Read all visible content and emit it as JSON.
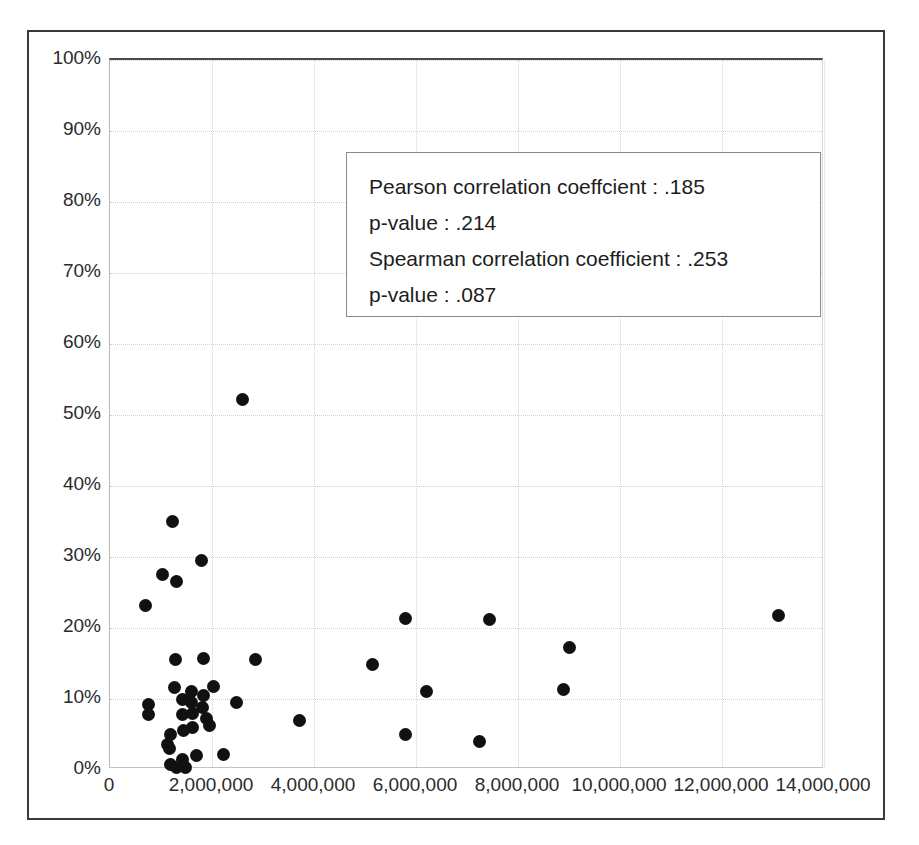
{
  "chart_data": {
    "type": "scatter",
    "title": "",
    "xlabel": "",
    "ylabel": "",
    "xlim": [
      0,
      14000000
    ],
    "ylim": [
      0,
      1.0
    ],
    "grid": true,
    "legend": null,
    "xticks": [
      0,
      2000000,
      4000000,
      6000000,
      8000000,
      10000000,
      12000000,
      14000000
    ],
    "xtick_labels": [
      "0",
      "2,000,000",
      "4,000,000",
      "6,000,000",
      "8,000,000",
      "10,000,000",
      "12,000,000",
      "14,000,000"
    ],
    "yticks": [
      0,
      0.1,
      0.2,
      0.3,
      0.4,
      0.5,
      0.6,
      0.7,
      0.8,
      0.9,
      1.0
    ],
    "ytick_labels": [
      "0%",
      "10%",
      "20%",
      "30%",
      "40%",
      "50%",
      "60%",
      "70%",
      "80%",
      "90%",
      "100%"
    ],
    "marker": {
      "shape": "circle",
      "color": "#111111",
      "size": 13
    },
    "points": [
      {
        "x": 2600000,
        "y": 0.522
      },
      {
        "x": 1230000,
        "y": 0.35
      },
      {
        "x": 1800000,
        "y": 0.295
      },
      {
        "x": 1020000,
        "y": 0.276
      },
      {
        "x": 1300000,
        "y": 0.266
      },
      {
        "x": 700000,
        "y": 0.231
      },
      {
        "x": 5800000,
        "y": 0.214
      },
      {
        "x": 7450000,
        "y": 0.212
      },
      {
        "x": 13100000,
        "y": 0.218
      },
      {
        "x": 9000000,
        "y": 0.172
      },
      {
        "x": 2850000,
        "y": 0.156
      },
      {
        "x": 1840000,
        "y": 0.157
      },
      {
        "x": 1280000,
        "y": 0.155
      },
      {
        "x": 5150000,
        "y": 0.148
      },
      {
        "x": 2020000,
        "y": 0.118
      },
      {
        "x": 1270000,
        "y": 0.116
      },
      {
        "x": 6200000,
        "y": 0.11
      },
      {
        "x": 8900000,
        "y": 0.114
      },
      {
        "x": 1840000,
        "y": 0.105
      },
      {
        "x": 1600000,
        "y": 0.11
      },
      {
        "x": 1430000,
        "y": 0.1
      },
      {
        "x": 1600000,
        "y": 0.095
      },
      {
        "x": 2480000,
        "y": 0.095
      },
      {
        "x": 1820000,
        "y": 0.088
      },
      {
        "x": 760000,
        "y": 0.092
      },
      {
        "x": 1620000,
        "y": 0.08
      },
      {
        "x": 1430000,
        "y": 0.078
      },
      {
        "x": 760000,
        "y": 0.078
      },
      {
        "x": 1900000,
        "y": 0.072
      },
      {
        "x": 1960000,
        "y": 0.062
      },
      {
        "x": 3720000,
        "y": 0.07
      },
      {
        "x": 1620000,
        "y": 0.06
      },
      {
        "x": 1450000,
        "y": 0.055
      },
      {
        "x": 1180000,
        "y": 0.05
      },
      {
        "x": 5800000,
        "y": 0.05
      },
      {
        "x": 7250000,
        "y": 0.04
      },
      {
        "x": 1120000,
        "y": 0.036
      },
      {
        "x": 1160000,
        "y": 0.03
      },
      {
        "x": 2220000,
        "y": 0.022
      },
      {
        "x": 1700000,
        "y": 0.02
      },
      {
        "x": 1420000,
        "y": 0.015
      },
      {
        "x": 1180000,
        "y": 0.008
      },
      {
        "x": 1300000,
        "y": 0.004
      },
      {
        "x": 1480000,
        "y": 0.004
      }
    ],
    "annotation": {
      "lines": [
        "Pearson correlation coeffcient :  .185",
        "p-value :  .214",
        "Spearman correlation coefficient :  .253",
        "p-value :  .087"
      ],
      "pearson_r": ".185",
      "pearson_p": ".214",
      "spearman_rho": ".253",
      "spearman_p": ".087"
    }
  }
}
